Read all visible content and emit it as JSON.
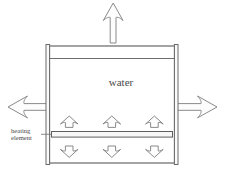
{
  "diagram": {
    "labels": {
      "water": "water",
      "heating_element_line1": "heating",
      "heating_element_line2": "element"
    },
    "colors": {
      "background": "#ffffff",
      "outline": "#5a5a5a",
      "arrow_stroke": "#8a8a8a",
      "arrow_fill": "#fdfdfd",
      "element_fill": "#f7f7f7",
      "text": "#4a4a4a"
    },
    "flow_arrows": [
      {
        "name": "outlet-arrow-top",
        "direction": "up",
        "size": "large"
      },
      {
        "name": "inlet-arrow-left",
        "direction": "left",
        "size": "large"
      },
      {
        "name": "outlet-arrow-right",
        "direction": "right",
        "size": "large"
      }
    ],
    "convection_arrows": {
      "above_element_direction": "up",
      "above_element_count": 3,
      "below_element_direction": "down",
      "below_element_count": 3
    }
  }
}
